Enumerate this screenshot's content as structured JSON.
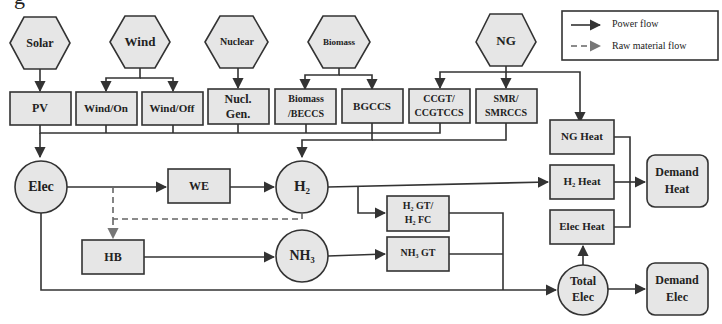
{
  "figure": {
    "cropped_title_fragment": "g"
  },
  "legend": {
    "power_flow": "Power flow",
    "raw_material_flow": "Raw material flow"
  },
  "sources": {
    "solar": "Solar",
    "wind": "Wind",
    "nuclear": "Nuclear",
    "biomass": "Biomass",
    "ng": "NG"
  },
  "technologies": {
    "pv": "PV",
    "wind_on": "Wind/On",
    "wind_off": "Wind/Off",
    "nucl_gen_1": "Nucl.",
    "nucl_gen_2": "Gen.",
    "biomass_beccs_1": "Biomass",
    "biomass_beccs_2": "/BECCS",
    "bgccs": "BGCCS",
    "ccgt_1": "CCGT/",
    "ccgt_2": "CCGTCCS",
    "smr_1": "SMR/",
    "smr_2": "SMRCCS",
    "we": "WE",
    "hb": "HB",
    "h2gt_1": "H₂ GT/",
    "h2gt_2": "H₂ FC",
    "nh3gt": "NH₃ GT",
    "ng_heat": "NG Heat",
    "h2_heat": "H₂ Heat",
    "elec_heat": "Elec Heat"
  },
  "carriers": {
    "elec": "Elec",
    "h2": "H₂",
    "nh3": "NH₃",
    "total_elec_1": "Total",
    "total_elec_2": "Elec"
  },
  "demands": {
    "heat_1": "Demand",
    "heat_2": "Heat",
    "elec_1": "Demand",
    "elec_2": "Elec"
  },
  "colors": {
    "node_fill": "#e6e6e6",
    "stroke": "#333333",
    "raw_material_arrow": "#777777"
  }
}
